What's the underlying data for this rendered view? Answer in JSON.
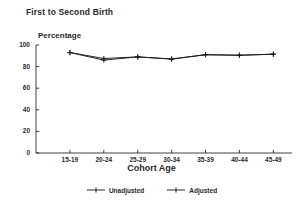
{
  "chart_data": {
    "type": "line",
    "title": "First to Second Birth",
    "xlabel": "Cohort Age",
    "ylabel": "Percentage",
    "categories": [
      "15-19",
      "20-24",
      "25-29",
      "30-34",
      "35-39",
      "40-44",
      "45-49"
    ],
    "series": [
      {
        "name": "Unadjusted",
        "values": [
          93,
          87.5,
          89,
          87,
          91,
          90.5,
          91.5
        ]
      },
      {
        "name": "Adjusted",
        "values": [
          93,
          86,
          89,
          87,
          91,
          90.5,
          91.5
        ]
      }
    ],
    "ylim": [
      0,
      100
    ],
    "yticks": [
      0,
      20,
      40,
      60,
      80,
      100
    ],
    "ytick_labels": [
      "0",
      "20",
      "40",
      "60",
      "80",
      "100"
    ],
    "grid": false,
    "legend_position": "bottom",
    "line_color": "#1a1a1a",
    "marker": "plus"
  },
  "axes": {
    "y_axis_name": "percentage-axis",
    "x_axis_name": "cohort-age-axis"
  }
}
